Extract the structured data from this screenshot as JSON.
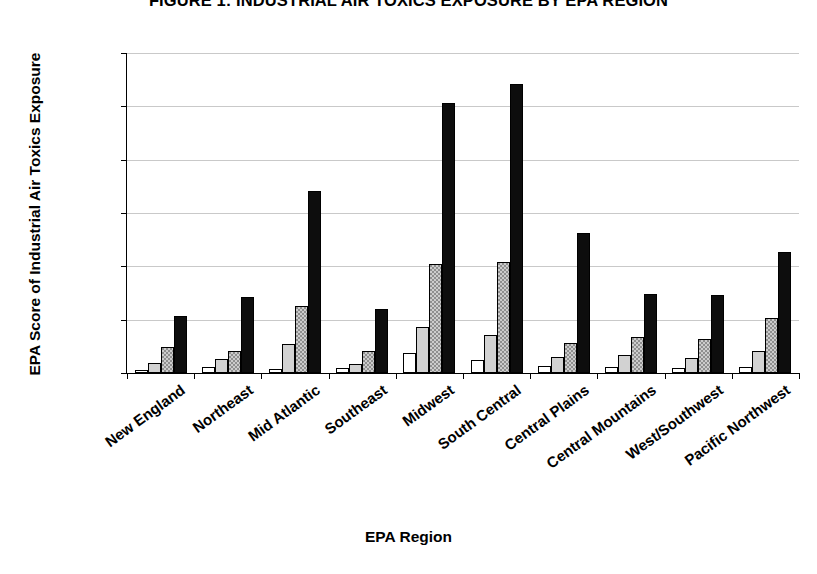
{
  "chart_data": {
    "type": "bar",
    "title": "FIGURE 1: INDUSTRIAL AIR TOXICS EXPOSURE BY EPA REGION",
    "xlabel": "EPA Region",
    "ylabel": "EPA Score of Industrial Air Toxics Exposure",
    "ylim": [
      0,
      30000
    ],
    "yticks": [
      0,
      5000,
      10000,
      15000,
      20000,
      25000,
      30000
    ],
    "ytick_labels": [
      "0",
      "5000",
      "10000",
      "15000",
      "20000",
      "25000",
      "30000"
    ],
    "grid": true,
    "legend": "none",
    "categories": [
      "New England",
      "Northeast",
      "Mid Atlantic",
      "Southeast",
      "Midwest",
      "South Central",
      "Central Plains",
      "Central Mountains",
      "West/Southwest",
      "Pacific Northwest"
    ],
    "series": [
      {
        "name": "series-1",
        "fill": "white",
        "color": "#ffffff",
        "values": [
          250,
          600,
          400,
          500,
          1850,
          1250,
          700,
          550,
          500,
          600
        ]
      },
      {
        "name": "series-2",
        "fill": "light-gray",
        "color": "#d2d2d2",
        "values": [
          900,
          1350,
          2700,
          800,
          4350,
          3600,
          1500,
          1700,
          1400,
          2100
        ]
      },
      {
        "name": "series-3",
        "fill": "dotted-gray",
        "color": "#8f8f8f",
        "values": [
          2400,
          2050,
          6300,
          2100,
          10200,
          10450,
          2850,
          3400,
          3150,
          5150
        ]
      },
      {
        "name": "series-4",
        "fill": "black",
        "color": "#0d0d0d",
        "values": [
          5300,
          7150,
          17050,
          6000,
          25300,
          27050,
          13100,
          7400,
          7350,
          11300
        ]
      }
    ]
  }
}
